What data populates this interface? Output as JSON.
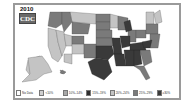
{
  "title": {
    "year": "2010",
    "logo": "CDC"
  },
  "colors": {
    "no_data": "#ffffff",
    "lt10": "#cfcfcf",
    "p10_14": "#a8a8a8",
    "p15_19": "#8c8c8c",
    "p20_24": "#c4c4c4",
    "p25_29": "#7a7a7a",
    "ge30": "#3a3a3a"
  },
  "legend": [
    {
      "label": "No Data",
      "color": "#ffffff"
    },
    {
      "label": "<10%",
      "color": "#cfcfcf"
    },
    {
      "label": "10%–14%",
      "color": "#a8a8a8"
    },
    {
      "label": "15%–19%",
      "color": "#2e2e2e"
    },
    {
      "label": "20%–24%",
      "color": "#c4c4c4"
    },
    {
      "label": "25%–29%",
      "color": "#7a7a7a"
    },
    {
      "label": "≥30%",
      "color": "#3a3a3a"
    }
  ]
}
